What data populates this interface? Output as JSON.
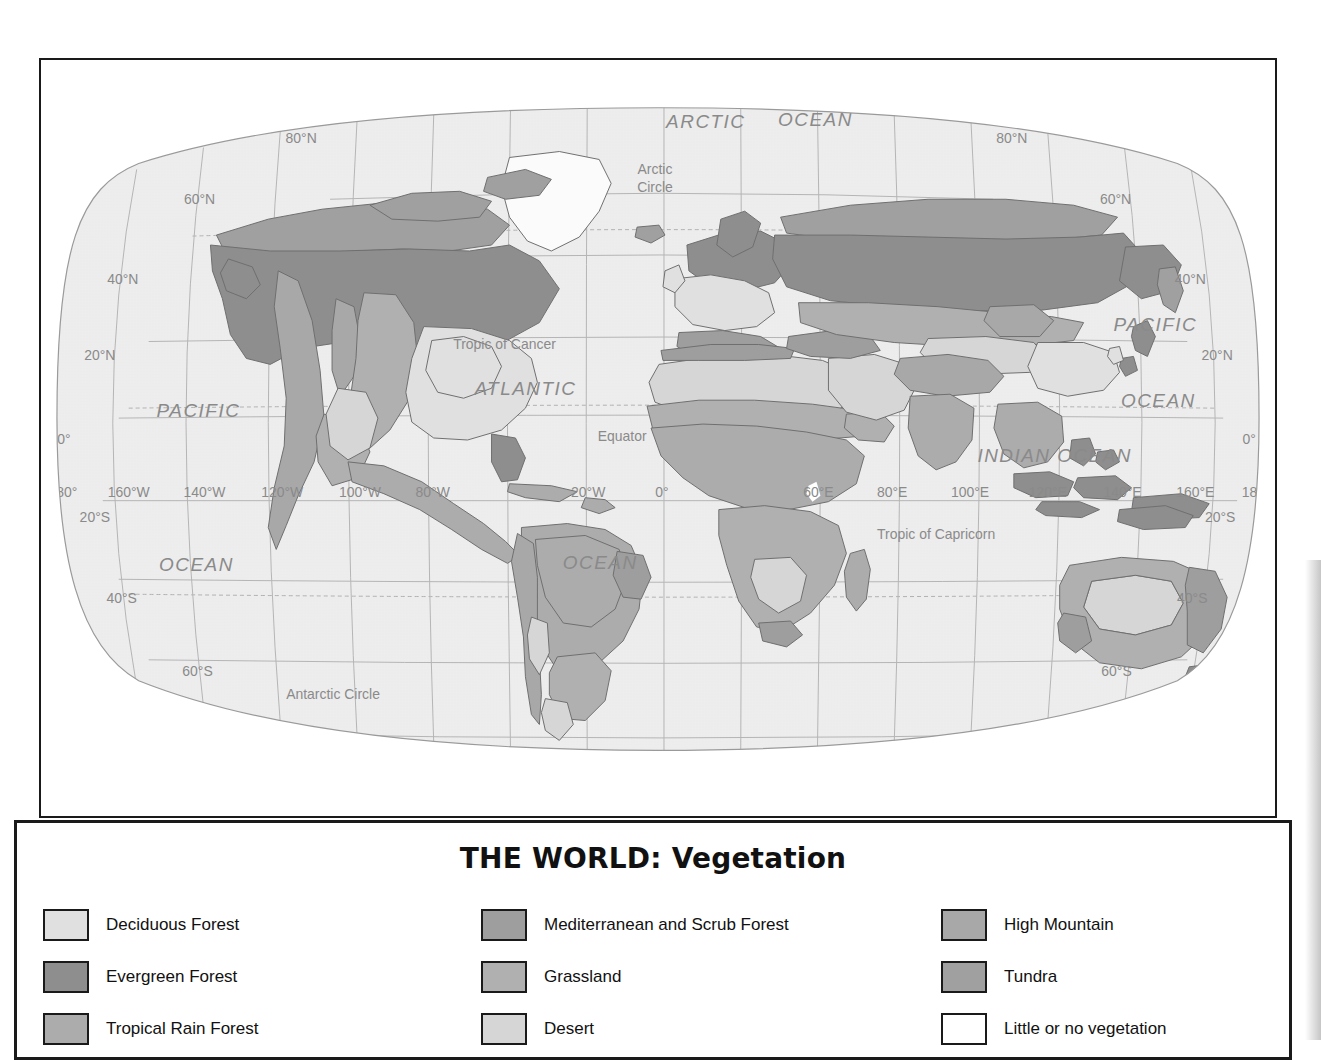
{
  "legend": {
    "title": "THE WORLD: Vegetation",
    "columns": [
      {
        "items": [
          {
            "label": "Deciduous Forest",
            "color": "#e0e0e0"
          },
          {
            "label": "Evergreen Forest",
            "color": "#8e8e8e"
          },
          {
            "label": "Tropical Rain Forest",
            "color": "#acacac"
          }
        ]
      },
      {
        "items": [
          {
            "label": "Mediterranean and Scrub Forest",
            "color": "#9e9e9e"
          },
          {
            "label": "Grassland",
            "color": "#b0b0b0"
          },
          {
            "label": "Desert",
            "color": "#d6d6d6"
          }
        ]
      },
      {
        "items": [
          {
            "label": "High Mountain",
            "color": "#a8a8a8"
          },
          {
            "label": "Tundra",
            "color": "#a0a0a0"
          },
          {
            "label": "Little or no vegetation",
            "color": "#ffffff"
          }
        ]
      }
    ]
  },
  "map": {
    "ocean_color": "#ededed",
    "graticule_color": "#a8a8a8",
    "coastline_color": "#6f6f6f",
    "label_color": "#8a8a8a",
    "oceans": [
      {
        "name": "ARCTIC",
        "x": 706,
        "y": 126,
        "size": 19,
        "italic": true
      },
      {
        "name": "OCEAN",
        "x": 816,
        "y": 124,
        "size": 19,
        "italic": true
      },
      {
        "name": "PACIFIC",
        "x": 197,
        "y": 417,
        "size": 19,
        "italic": true
      },
      {
        "name": "OCEAN",
        "x": 195,
        "y": 572,
        "size": 19,
        "italic": true
      },
      {
        "name": "ATLANTIC",
        "x": 525,
        "y": 395,
        "size": 19,
        "italic": true
      },
      {
        "name": "OCEAN",
        "x": 600,
        "y": 570,
        "size": 19,
        "italic": true
      },
      {
        "name": "INDIAN OCEAN",
        "x": 1056,
        "y": 462,
        "size": 19,
        "italic": true
      },
      {
        "name": "PACIFIC",
        "x": 1157,
        "y": 330,
        "size": 19,
        "italic": true
      },
      {
        "name": "OCEAN",
        "x": 1160,
        "y": 407,
        "size": 19,
        "italic": true
      }
    ],
    "reference_lines": [
      {
        "label": "Arctic Circle",
        "x": 655,
        "y": 173,
        "two_line": true
      },
      {
        "label": "Tropic of Cancer",
        "x": 504,
        "y": 349
      },
      {
        "label": "Equator",
        "x": 622,
        "y": 441
      },
      {
        "label": "Tropic of Capricorn",
        "x": 937,
        "y": 540
      },
      {
        "label": "Antarctic Circle",
        "x": 332,
        "y": 700
      }
    ],
    "latitude_labels_left": [
      {
        "label": "80°N",
        "x": 300,
        "y": 141
      },
      {
        "label": "60°N",
        "x": 198,
        "y": 203
      },
      {
        "label": "40°N",
        "x": 121,
        "y": 283
      },
      {
        "label": "20°N",
        "x": 98,
        "y": 360
      },
      {
        "label": "0°",
        "x": 62,
        "y": 444
      },
      {
        "label": "20°S",
        "x": 93,
        "y": 522
      },
      {
        "label": "40°S",
        "x": 120,
        "y": 604
      },
      {
        "label": "60°S",
        "x": 196,
        "y": 677
      },
      {
        "label": "80°S",
        "x": 299,
        "y": 740
      }
    ],
    "latitude_labels_right": [
      {
        "label": "80°N",
        "x": 1013,
        "y": 141
      },
      {
        "label": "60°N",
        "x": 1117,
        "y": 203
      },
      {
        "label": "40°N",
        "x": 1192,
        "y": 283
      },
      {
        "label": "20°N",
        "x": 1219,
        "y": 360
      },
      {
        "label": "0°",
        "x": 1251,
        "y": 444
      },
      {
        "label": "20°S",
        "x": 1222,
        "y": 522
      },
      {
        "label": "40°S",
        "x": 1194,
        "y": 604
      },
      {
        "label": "60°S",
        "x": 1118,
        "y": 677
      },
      {
        "label": "80°S",
        "x": 1014,
        "y": 740
      }
    ],
    "longitude_labels": [
      {
        "label": "180°",
        "x": 61,
        "y": 497
      },
      {
        "label": "160°W",
        "x": 127,
        "y": 497
      },
      {
        "label": "140°W",
        "x": 203,
        "y": 497
      },
      {
        "label": "120°W",
        "x": 281,
        "y": 497
      },
      {
        "label": "100°W",
        "x": 359,
        "y": 497
      },
      {
        "label": "80°W",
        "x": 432,
        "y": 497
      },
      {
        "label": "20°W",
        "x": 588,
        "y": 497
      },
      {
        "label": "0°",
        "x": 662,
        "y": 497
      },
      {
        "label": "60°E",
        "x": 819,
        "y": 497
      },
      {
        "label": "80°E",
        "x": 893,
        "y": 497
      },
      {
        "label": "100°E",
        "x": 971,
        "y": 497
      },
      {
        "label": "120°E",
        "x": 1049,
        "y": 497
      },
      {
        "label": "140°E",
        "x": 1124,
        "y": 497
      },
      {
        "label": "160°E",
        "x": 1197,
        "y": 497
      },
      {
        "label": "180°",
        "x": 1258,
        "y": 497
      }
    ]
  }
}
